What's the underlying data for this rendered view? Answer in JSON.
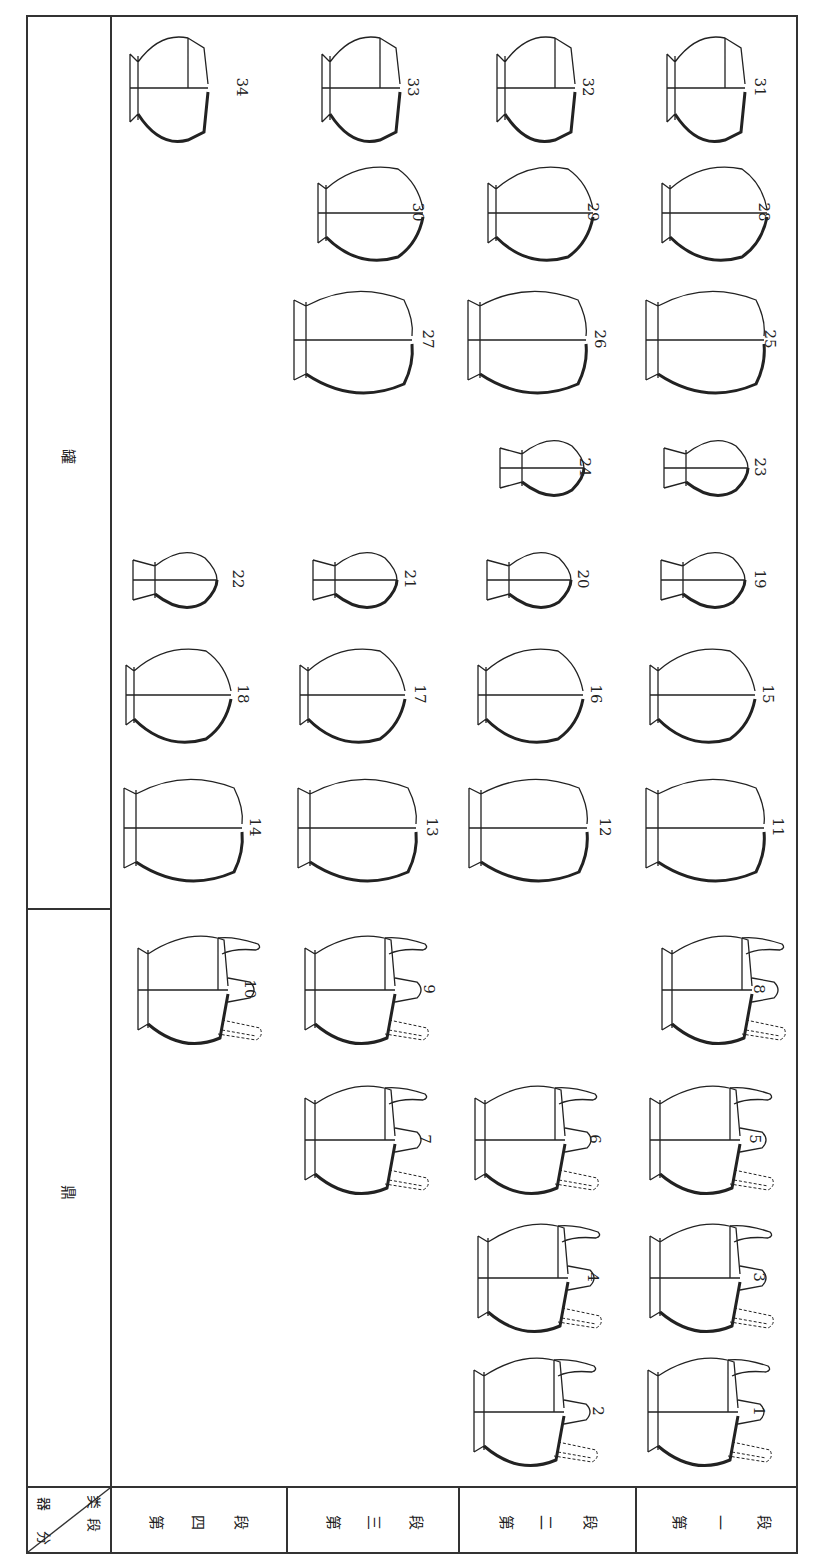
{
  "figure": {
    "orientation": "rotated 90 degrees clockwise",
    "corner_header": {
      "top": "器类",
      "bottom": "分段",
      "top_chars": [
        "器",
        "类"
      ],
      "bottom_chars": [
        "分",
        "段"
      ]
    },
    "categories": [
      {
        "label": "罐",
        "name": "jar",
        "vessel_numbers": [
          11,
          12,
          13,
          14,
          15,
          16,
          17,
          18,
          19,
          20,
          21,
          22,
          23,
          24,
          25,
          26,
          27,
          28,
          29,
          30,
          31,
          32,
          33,
          34
        ]
      },
      {
        "label": "鼎",
        "name": "tripod",
        "vessel_numbers": [
          1,
          2,
          3,
          4,
          5,
          6,
          7,
          8,
          9,
          10
        ]
      }
    ],
    "periods": [
      {
        "label": "第四段",
        "chars": [
          "第",
          "四",
          "段"
        ]
      },
      {
        "label": "第三段",
        "chars": [
          "第",
          "三",
          "段"
        ]
      },
      {
        "label": "第二段",
        "chars": [
          "第",
          "二",
          "段"
        ]
      },
      {
        "label": "第一段",
        "chars": [
          "第",
          "一",
          "段"
        ]
      }
    ],
    "vessels": [
      {
        "n": "34",
        "period": "第四段",
        "category": "罐"
      },
      {
        "n": "33",
        "period": "第三段",
        "category": "罐"
      },
      {
        "n": "32",
        "period": "第二段",
        "category": "罐"
      },
      {
        "n": "31",
        "period": "第一段",
        "category": "罐"
      },
      {
        "n": "30",
        "period": "第三段",
        "category": "罐"
      },
      {
        "n": "29",
        "period": "第二段",
        "category": "罐"
      },
      {
        "n": "28",
        "period": "第一段",
        "category": "罐"
      },
      {
        "n": "27",
        "period": "第三段",
        "category": "罐"
      },
      {
        "n": "26",
        "period": "第二段",
        "category": "罐"
      },
      {
        "n": "25",
        "period": "第一段",
        "category": "罐"
      },
      {
        "n": "24",
        "period": "第二段",
        "category": "罐"
      },
      {
        "n": "23",
        "period": "第一段",
        "category": "罐"
      },
      {
        "n": "22",
        "period": "第四段",
        "category": "罐"
      },
      {
        "n": "21",
        "period": "第三段",
        "category": "罐"
      },
      {
        "n": "20",
        "period": "第二段",
        "category": "罐"
      },
      {
        "n": "19",
        "period": "第一段",
        "category": "罐"
      },
      {
        "n": "18",
        "period": "第四段",
        "category": "罐"
      },
      {
        "n": "17",
        "period": "第三段",
        "category": "罐"
      },
      {
        "n": "16",
        "period": "第二段",
        "category": "罐"
      },
      {
        "n": "15",
        "period": "第一段",
        "category": "罐"
      },
      {
        "n": "14",
        "period": "第四段",
        "category": "罐"
      },
      {
        "n": "13",
        "period": "第三段",
        "category": "罐"
      },
      {
        "n": "12",
        "period": "第二段",
        "category": "罐"
      },
      {
        "n": "11",
        "period": "第一段",
        "category": "罐"
      },
      {
        "n": "10",
        "period": "第四段",
        "category": "鼎"
      },
      {
        "n": "9",
        "period": "第三段",
        "category": "鼎"
      },
      {
        "n": "8",
        "period": "第一段",
        "category": "鼎"
      },
      {
        "n": "7",
        "period": "第三段",
        "category": "鼎"
      },
      {
        "n": "6",
        "period": "第二段",
        "category": "鼎"
      },
      {
        "n": "5",
        "period": "第一段",
        "category": "鼎"
      },
      {
        "n": "4",
        "period": "第二段",
        "category": "鼎"
      },
      {
        "n": "3",
        "period": "第一段",
        "category": "鼎"
      },
      {
        "n": "2",
        "period": "第二段",
        "category": "鼎"
      },
      {
        "n": "1",
        "period": "第一段",
        "category": "鼎"
      }
    ]
  }
}
